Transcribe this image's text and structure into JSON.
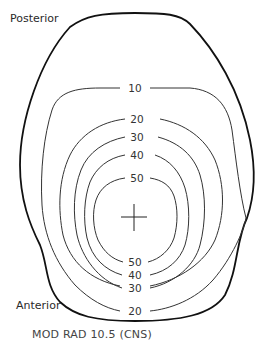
{
  "diagram": {
    "labels": {
      "posterior": "Posterior",
      "anterior": "Anterior"
    },
    "caption": "MOD RAD 10.5 (CNS)",
    "isodose_levels": [
      "10",
      "20",
      "30",
      "40",
      "50"
    ],
    "top_labels": {
      "10": "10",
      "20": "20",
      "30": "30",
      "40": "40",
      "50": "50"
    },
    "bottom_labels": {
      "20": "20",
      "30": "30",
      "40": "40",
      "50": "50"
    },
    "center_marker": "crosshair",
    "line_color": "#222222"
  }
}
